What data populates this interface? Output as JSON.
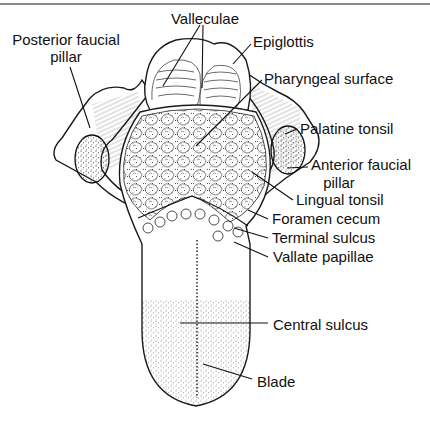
{
  "figure": {
    "colors": {
      "ink": "#111111",
      "rule": "#8a8a8a",
      "background": "#ffffff"
    }
  },
  "labels": {
    "valleculae": "Valleculae",
    "epiglottis": "Epiglottis",
    "posterior_faucial_pillar_line1": "Posterior faucial",
    "posterior_faucial_pillar_line2": "pillar",
    "pharyngeal_surface": "Pharyngeal surface",
    "palatine_tonsil": "Palatine tonsil",
    "anterior_faucial_pillar_line1": "Anterior faucial",
    "anterior_faucial_pillar_line2": "pillar",
    "lingual_tonsil": "Lingual tonsil",
    "foramen_cecum": "Foramen cecum",
    "terminal_sulcus": "Terminal sulcus",
    "vallate_papillae": "Vallate papillae",
    "central_sulcus": "Central sulcus",
    "blade": "Blade"
  }
}
